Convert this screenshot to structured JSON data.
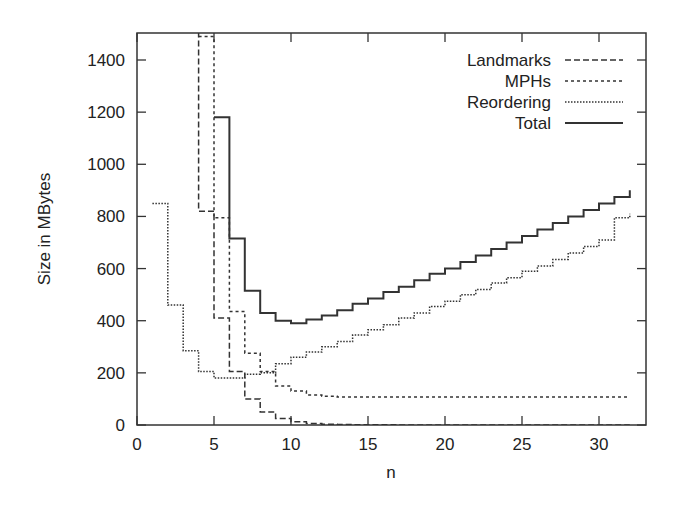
{
  "chart_data": {
    "type": "line",
    "step": true,
    "title": "",
    "xlabel": "n",
    "ylabel": "Size in MBytes",
    "xlim": [
      0,
      33
    ],
    "ylim": [
      0,
      1500
    ],
    "xticks": [
      0,
      5,
      10,
      15,
      20,
      25,
      30
    ],
    "yticks": [
      0,
      200,
      400,
      600,
      800,
      1000,
      1200,
      1400
    ],
    "grid": false,
    "legend_position": "top-right",
    "series": [
      {
        "name": "Landmarks",
        "style": "dashed",
        "x": [
          3,
          4,
          5,
          6,
          7,
          8,
          9,
          10,
          11,
          12,
          13,
          14,
          15,
          16,
          17,
          18,
          19,
          20,
          21,
          22,
          23,
          24,
          25,
          26,
          27,
          28,
          29,
          30,
          31,
          32
        ],
        "values": [
          1500,
          820,
          410,
          205,
          100,
          50,
          25,
          12,
          6,
          3,
          2,
          1,
          1,
          1,
          0,
          0,
          0,
          0,
          0,
          0,
          0,
          0,
          0,
          0,
          0,
          0,
          0,
          0,
          0,
          0
        ]
      },
      {
        "name": "MPHs",
        "style": "dotted-coarse",
        "x": [
          4,
          5,
          6,
          7,
          8,
          9,
          10,
          11,
          12,
          13,
          14,
          15,
          16,
          17,
          18,
          19,
          20,
          21,
          22,
          23,
          24,
          25,
          26,
          27,
          28,
          29,
          30,
          31,
          32
        ],
        "values": [
          1490,
          795,
          435,
          275,
          205,
          150,
          130,
          115,
          110,
          107,
          107,
          107,
          107,
          107,
          107,
          107,
          107,
          107,
          107,
          107,
          107,
          107,
          107,
          107,
          107,
          107,
          107,
          107,
          107
        ]
      },
      {
        "name": "Reordering",
        "style": "dotted-fine",
        "x": [
          1,
          2,
          3,
          4,
          5,
          6,
          7,
          8,
          9,
          10,
          11,
          12,
          13,
          14,
          15,
          16,
          17,
          18,
          19,
          20,
          21,
          22,
          23,
          24,
          25,
          26,
          27,
          28,
          29,
          30,
          31,
          32
        ],
        "values": [
          850,
          460,
          285,
          205,
          180,
          180,
          195,
          200,
          235,
          260,
          280,
          300,
          320,
          345,
          365,
          385,
          410,
          430,
          455,
          475,
          500,
          520,
          545,
          565,
          590,
          610,
          635,
          660,
          685,
          710,
          795,
          810
        ]
      },
      {
        "name": "Total",
        "style": "solid",
        "x": [
          5,
          6,
          7,
          8,
          9,
          10,
          11,
          12,
          13,
          14,
          15,
          16,
          17,
          18,
          19,
          20,
          21,
          22,
          23,
          24,
          25,
          26,
          27,
          28,
          29,
          30,
          31,
          32
        ],
        "values": [
          1180,
          715,
          515,
          430,
          400,
          390,
          405,
          420,
          440,
          465,
          485,
          510,
          530,
          555,
          580,
          600,
          625,
          650,
          675,
          700,
          725,
          750,
          775,
          800,
          825,
          850,
          875,
          900
        ]
      }
    ]
  }
}
